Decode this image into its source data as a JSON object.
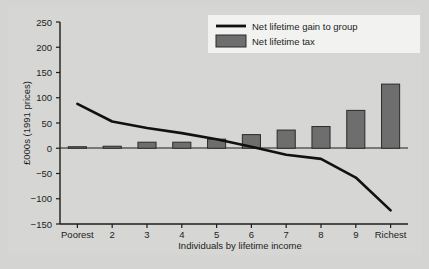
{
  "chart_data": {
    "type": "bar",
    "title": "",
    "subtitle": "",
    "xlabel": "Individuals by lifetime income",
    "ylabel": "£000s (1991 prices)",
    "categories": [
      "Poorest",
      "2",
      "3",
      "4",
      "5",
      "6",
      "7",
      "8",
      "9",
      "Richest"
    ],
    "ylim": [
      -150,
      250
    ],
    "yticks": [
      -150,
      -100,
      -50,
      0,
      50,
      100,
      150,
      200,
      250
    ],
    "ytick_labels": [
      "−150",
      "−100",
      "−50",
      "0",
      "50",
      "100",
      "150",
      "200",
      "250"
    ],
    "grid": false,
    "legend_position": "top-right",
    "series": [
      {
        "name": "Net lifetime tax",
        "kind": "bar",
        "color": "#6e6e6e",
        "values": [
          3,
          4,
          12,
          12,
          18,
          27,
          36,
          43,
          75,
          127
        ]
      },
      {
        "name": "Net lifetime gain to group",
        "kind": "line",
        "color": "#111111",
        "values": [
          88,
          53,
          40,
          30,
          18,
          3,
          -13,
          -21,
          -58,
          -123
        ]
      }
    ],
    "legend": [
      {
        "label": "Net lifetime gain to group",
        "marker": "line",
        "color": "#111111"
      },
      {
        "label": "Net lifetime tax",
        "marker": "swatch",
        "color": "#6e6e6e"
      }
    ]
  },
  "axes": {
    "y_axis_title": "£000s (1991 prices)",
    "x_axis_title": "Individuals by lifetime income"
  }
}
